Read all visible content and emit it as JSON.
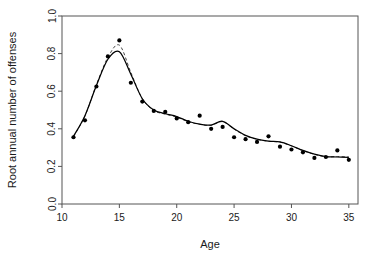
{
  "chart_data": {
    "type": "scatter",
    "title": "",
    "subtitle": "",
    "xlabel": "Age",
    "ylabel": "Root annual number of offenses",
    "xlim": [
      10.0,
      35.8
    ],
    "ylim": [
      0.0,
      1.0
    ],
    "xticks": [
      10,
      15,
      20,
      25,
      30,
      35
    ],
    "xtick_labels": [
      "10",
      "15",
      "20",
      "25",
      "30",
      "35"
    ],
    "yticks": [
      0.0,
      0.2,
      0.4,
      0.6,
      0.8,
      1.0
    ],
    "ytick_labels": [
      "0.0",
      "0.2",
      "0.4",
      "0.6",
      "0.8",
      "1.0"
    ],
    "grid": false,
    "legend": "none",
    "box_frame": true,
    "x": [
      11,
      12,
      13,
      14,
      15,
      16,
      17,
      18,
      19,
      20,
      21,
      22,
      23,
      24,
      25,
      26,
      27,
      28,
      29,
      30,
      31,
      32,
      33,
      34,
      35
    ],
    "series": [
      {
        "name": "observed points",
        "kind": "points",
        "marker": "filled-circle",
        "color": "#000000",
        "values": [
          0.355,
          0.445,
          0.625,
          0.785,
          0.87,
          0.645,
          0.545,
          0.495,
          0.49,
          0.455,
          0.435,
          0.47,
          0.4,
          0.41,
          0.355,
          0.345,
          0.33,
          0.36,
          0.305,
          0.29,
          0.275,
          0.245,
          0.25,
          0.285,
          0.235
        ]
      },
      {
        "name": "solid smooth fit",
        "kind": "line",
        "style": "solid",
        "color": "#000000",
        "values": [
          0.36,
          0.47,
          0.63,
          0.77,
          0.81,
          0.69,
          0.56,
          0.5,
          0.48,
          0.465,
          0.44,
          0.425,
          0.42,
          0.44,
          0.4,
          0.365,
          0.345,
          0.335,
          0.33,
          0.31,
          0.285,
          0.265,
          0.252,
          0.25,
          0.248
        ]
      },
      {
        "name": "dashed smooth fit",
        "kind": "line",
        "style": "dashed",
        "color": "#4a4a4a",
        "values": [
          0.358,
          0.468,
          0.635,
          0.78,
          0.845,
          0.7,
          0.56,
          0.497,
          0.478,
          0.462,
          0.438,
          0.424,
          0.419,
          0.438,
          0.398,
          0.363,
          0.344,
          0.334,
          0.329,
          0.309,
          0.284,
          0.264,
          0.251,
          0.252,
          0.25
        ]
      }
    ]
  },
  "axes": {
    "x_title": "Age",
    "y_title": "Root annual number of offenses"
  }
}
